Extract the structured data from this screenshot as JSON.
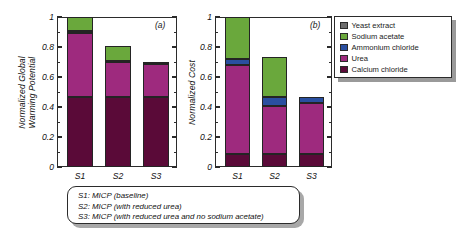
{
  "figure": {
    "background": "#ffffff",
    "caption_lines": [
      "S1: MICP (baseline)",
      "S2: MICP (with reduced urea)",
      "S3: MICP (with reduced urea and no sodium acetate)"
    ]
  },
  "legend": {
    "position": "right",
    "entries": [
      {
        "label": "Yeast extract",
        "color": "#6d6d6d"
      },
      {
        "label": "Sodium acetate",
        "color": "#6aa83c"
      },
      {
        "label": "Ammonium chloride",
        "color": "#2a4fa0"
      },
      {
        "label": "Urea",
        "color": "#9e2a7e"
      },
      {
        "label": "Calcium chloride",
        "color": "#5a0a38"
      }
    ]
  },
  "chart_data": [
    {
      "type": "bar",
      "id": "a",
      "panel_tag": "(a)",
      "title": "",
      "xlabel": "",
      "ylabel": "Normalized Global Warming Potential",
      "ylabel_lines": [
        "Normalized Global",
        "Warming Potential"
      ],
      "ylim": [
        0,
        1
      ],
      "ytick_labels": [
        "0",
        "0.2",
        "0.4",
        "0.6",
        "0.8",
        "1"
      ],
      "ytick_values": [
        0,
        0.2,
        0.4,
        0.6,
        0.8,
        1
      ],
      "minor_ticks": [
        0.1,
        0.3,
        0.5,
        0.7,
        0.9
      ],
      "grid": false,
      "stacked": true,
      "categories": [
        "S1",
        "S2",
        "S3"
      ],
      "series": [
        {
          "name": "Calcium chloride",
          "color": "#5a0a38",
          "values": [
            0.47,
            0.47,
            0.47
          ]
        },
        {
          "name": "Urea",
          "color": "#9e2a7e",
          "values": [
            0.425,
            0.23,
            0.215
          ]
        },
        {
          "name": "Ammonium chloride",
          "color": "#2a4fa0",
          "values": [
            0.01,
            0.01,
            0.01
          ]
        },
        {
          "name": "Sodium acetate",
          "color": "#6aa83c",
          "values": [
            0.095,
            0.1,
            0.0
          ]
        },
        {
          "name": "Yeast extract",
          "color": "#6d6d6d",
          "values": [
            0.0,
            0.0,
            0.0
          ]
        }
      ],
      "totals": [
        1.0,
        0.81,
        0.695
      ]
    },
    {
      "type": "bar",
      "id": "b",
      "panel_tag": "(b)",
      "title": "",
      "xlabel": "",
      "ylabel": "Normalized Cost",
      "ylabel_lines": [
        "Normalized Cost"
      ],
      "ylim": [
        0,
        1
      ],
      "ytick_labels": [
        "0",
        "0.2",
        "0.4",
        "0.6",
        "0.8",
        "1"
      ],
      "ytick_values": [
        0,
        0.2,
        0.4,
        0.6,
        0.8,
        1
      ],
      "minor_ticks": [
        0.1,
        0.3,
        0.5,
        0.7,
        0.9
      ],
      "grid": false,
      "stacked": true,
      "categories": [
        "S1",
        "S2",
        "S3"
      ],
      "series": [
        {
          "name": "Calcium chloride",
          "color": "#5a0a38",
          "values": [
            0.09,
            0.085,
            0.09
          ]
        },
        {
          "name": "Urea",
          "color": "#9e2a7e",
          "values": [
            0.59,
            0.325,
            0.335
          ]
        },
        {
          "name": "Ammonium chloride",
          "color": "#2a4fa0",
          "values": [
            0.04,
            0.055,
            0.04
          ]
        },
        {
          "name": "Sodium acetate",
          "color": "#6aa83c",
          "values": [
            0.28,
            0.27,
            0.0
          ]
        },
        {
          "name": "Yeast extract",
          "color": "#6d6d6d",
          "values": [
            0.0,
            0.0,
            0.0
          ]
        }
      ],
      "totals": [
        1.0,
        0.735,
        0.465
      ]
    }
  ]
}
